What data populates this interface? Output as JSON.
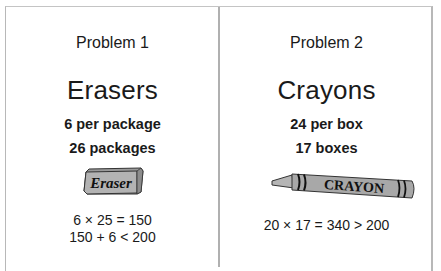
{
  "problems": [
    {
      "title": "Problem 1",
      "item": "Erasers",
      "rate": "6 per package",
      "quantity": "26 packages",
      "image": {
        "type": "eraser-icon",
        "label": "Eraser"
      },
      "calculations": [
        "6 × 25 = 150",
        "150 + 6 < 200"
      ]
    },
    {
      "title": "Problem 2",
      "item": "Crayons",
      "rate": "24 per box",
      "quantity": "17 boxes",
      "image": {
        "type": "crayon-icon",
        "label": "CRAYON"
      },
      "calculations": [
        "20 × 17 = 340 > 200"
      ]
    }
  ],
  "colors": {
    "border": "#b8b8b8",
    "text": "#1a1a1a",
    "image_fill": "#a9a9a9",
    "image_outline": "#222222"
  }
}
